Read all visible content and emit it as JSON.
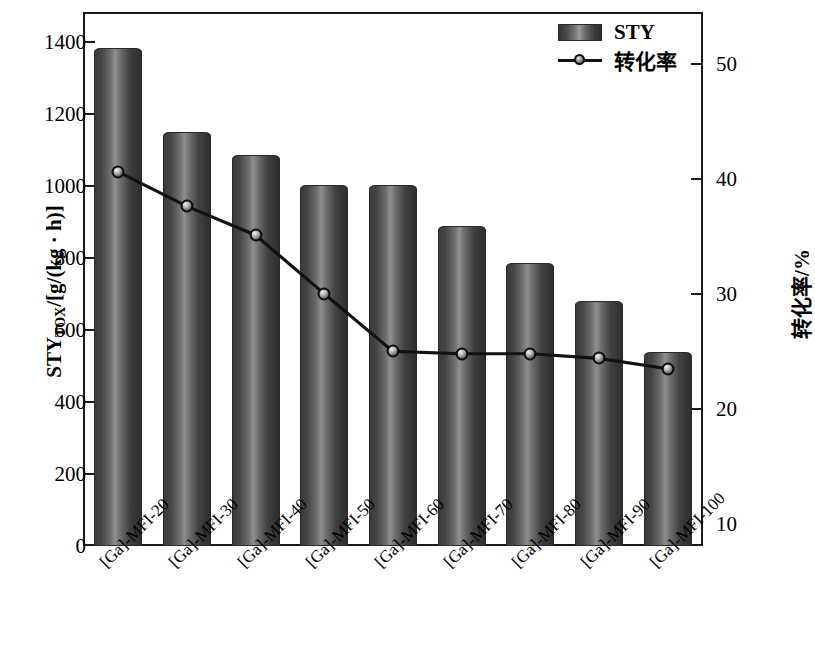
{
  "chart_data": {
    "type": "bar",
    "title": "",
    "categories": [
      "[Ga]-MFI-20",
      "[Ga]-MFI-30",
      "[Ga]-MFI-40",
      "[Ga]-MFI-50",
      "[Ga]-MFI-60",
      "[Ga]-MFI-70",
      "[Ga]-MFI-80",
      "[Ga]-MFI-90",
      "[Ga]-MFI-100"
    ],
    "xlabel": "",
    "series": [
      {
        "name": "STY",
        "type": "bar",
        "axis": "left",
        "values": [
          1382,
          1150,
          1085,
          1003,
          1003,
          888,
          785,
          680,
          540
        ]
      },
      {
        "name": "转化率",
        "type": "line",
        "axis": "right",
        "values": [
          40.6,
          37.6,
          35.1,
          30.0,
          25.0,
          24.8,
          24.8,
          24.4,
          23.5
        ]
      }
    ],
    "left_axis": {
      "label": "STY",
      "label_sub": "TOX",
      "label_unit": "/[g/(kg · h)]",
      "ticks": [
        0,
        200,
        400,
        600,
        800,
        1000,
        1200,
        1400
      ],
      "ylim": [
        0,
        1480
      ]
    },
    "right_axis": {
      "label": "转化率/%",
      "ticks": [
        10,
        20,
        30,
        40,
        50
      ],
      "ylim": [
        8.1,
        54.4
      ]
    },
    "legend": {
      "position": "top-right",
      "entries": [
        {
          "label": "STY",
          "marker": "bar-swatch"
        },
        {
          "label": "转化率",
          "marker": "line-with-circle"
        }
      ]
    },
    "grid": false,
    "colors": {
      "axis": "#1a1a1a",
      "bar_light": "#9b9b9b",
      "bar_dark": "#2e2e2e",
      "line": "#111111",
      "background": "#ffffff"
    }
  }
}
